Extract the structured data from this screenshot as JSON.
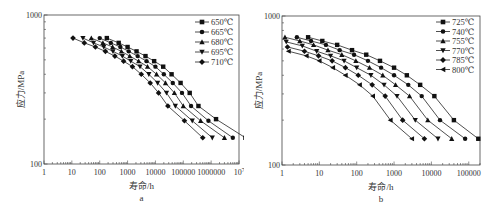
{
  "chart_data": [
    {
      "type": "line",
      "panel_label": "a",
      "xlabel": "寿命/h",
      "ylabel": "应力/MPa",
      "xscale": "log",
      "yscale": "log",
      "xlim": [
        1,
        10000000
      ],
      "ylim": [
        100,
        1000
      ],
      "x_ticks": [
        "1",
        "10",
        "100",
        "1000",
        "10000",
        "100000",
        "1000000",
        "10^7"
      ],
      "y_ticks": [
        "100",
        "1000"
      ],
      "grid": false,
      "legend_position": "upper right",
      "series": [
        {
          "name": "650℃",
          "marker": "square",
          "points": [
            [
              180,
              700
            ],
            [
              480,
              650
            ],
            [
              1000,
              610
            ],
            [
              2100,
              570
            ],
            [
              4400,
              530
            ],
            [
              9000,
              490
            ],
            [
              19000,
              450
            ],
            [
              38000,
              400
            ],
            [
              80000,
              350
            ],
            [
              170000,
              300
            ],
            [
              350000,
              245
            ],
            [
              1500000,
              200
            ],
            [
              17000000,
              150
            ]
          ]
        },
        {
          "name": "665℃",
          "marker": "circle",
          "points": [
            [
              100,
              700
            ],
            [
              250,
              650
            ],
            [
              550,
              610
            ],
            [
              1100,
              570
            ],
            [
              2300,
              530
            ],
            [
              4800,
              490
            ],
            [
              10000,
              450
            ],
            [
              20000,
              400
            ],
            [
              42000,
              350
            ],
            [
              90000,
              300
            ],
            [
              190000,
              245
            ],
            [
              800000,
              195
            ],
            [
              6000000,
              150
            ]
          ]
        },
        {
          "name": "680℃",
          "marker": "triangle-up",
          "points": [
            [
              50,
              700
            ],
            [
              130,
              650
            ],
            [
              290,
              610
            ],
            [
              600,
              570
            ],
            [
              1200,
              530
            ],
            [
              2500,
              490
            ],
            [
              5200,
              450
            ],
            [
              11000,
              400
            ],
            [
              23000,
              350
            ],
            [
              48000,
              300
            ],
            [
              100000,
              245
            ],
            [
              420000,
              195
            ],
            [
              3000000,
              150
            ]
          ]
        },
        {
          "name": "695℃",
          "marker": "triangle-down",
          "points": [
            [
              25,
              700
            ],
            [
              60,
              650
            ],
            [
              140,
              610
            ],
            [
              300,
              570
            ],
            [
              650,
              530
            ],
            [
              1300,
              490
            ],
            [
              2800,
              450
            ],
            [
              5800,
              400
            ],
            [
              12000,
              350
            ],
            [
              25000,
              300
            ],
            [
              52000,
              245
            ],
            [
              210000,
              195
            ],
            [
              1100000,
              150
            ]
          ]
        },
        {
          "name": "710℃",
          "marker": "diamond",
          "points": [
            [
              11,
              700
            ],
            [
              28,
              650
            ],
            [
              70,
              610
            ],
            [
              160,
              570
            ],
            [
              350,
              530
            ],
            [
              720,
              490
            ],
            [
              1500,
              450
            ],
            [
              3100,
              400
            ],
            [
              6500,
              350
            ],
            [
              13000,
              300
            ],
            [
              28000,
              245
            ],
            [
              110000,
              195
            ],
            [
              500000,
              150
            ]
          ]
        }
      ]
    },
    {
      "type": "line",
      "panel_label": "b",
      "xlabel": "寿命/h",
      "ylabel": "应力/MPa",
      "xscale": "log",
      "yscale": "log",
      "xlim": [
        1,
        200000
      ],
      "ylim": [
        100,
        1000
      ],
      "x_ticks": [
        "1",
        "10",
        "100",
        "1000",
        "10000",
        "100000"
      ],
      "y_ticks": [
        "100",
        "1000"
      ],
      "grid": false,
      "legend_position": "upper right",
      "series": [
        {
          "name": "725℃",
          "marker": "square",
          "points": [
            [
              5,
              720
            ],
            [
              12,
              680
            ],
            [
              30,
              640
            ],
            [
              75,
              590
            ],
            [
              180,
              550
            ],
            [
              420,
              500
            ],
            [
              1000,
              450
            ],
            [
              2200,
              400
            ],
            [
              5000,
              345
            ],
            [
              12000,
              290
            ],
            [
              40000,
              200
            ],
            [
              180000,
              150
            ]
          ]
        },
        {
          "name": "740℃",
          "marker": "circle",
          "points": [
            [
              2.5,
              720
            ],
            [
              6,
              680
            ],
            [
              15,
              640
            ],
            [
              35,
              590
            ],
            [
              85,
              550
            ],
            [
              200,
              500
            ],
            [
              450,
              450
            ],
            [
              1000,
              400
            ],
            [
              2400,
              345
            ],
            [
              5500,
              290
            ],
            [
              17000,
              200
            ],
            [
              80000,
              150
            ]
          ]
        },
        {
          "name": "755℃",
          "marker": "triangle-up",
          "points": [
            [
              1.2,
              720
            ],
            [
              3,
              680
            ],
            [
              7,
              640
            ],
            [
              17,
              590
            ],
            [
              40,
              550
            ],
            [
              95,
              500
            ],
            [
              220,
              450
            ],
            [
              500,
              400
            ],
            [
              1100,
              345
            ],
            [
              2600,
              290
            ],
            [
              8000,
              200
            ],
            [
              35000,
              150
            ]
          ]
        },
        {
          "name": "770℃",
          "marker": "triangle-down",
          "points": [
            [
              1.3,
              670
            ],
            [
              3.5,
              630
            ],
            [
              8.5,
              580
            ],
            [
              20,
              540
            ],
            [
              46,
              500
            ],
            [
              100,
              450
            ],
            [
              240,
              400
            ],
            [
              540,
              345
            ],
            [
              1200,
              290
            ],
            [
              3700,
              200
            ],
            [
              15000,
              150
            ]
          ]
        },
        {
          "name": "785℃",
          "marker": "diamond",
          "points": [
            [
              1.4,
              620
            ],
            [
              4,
              580
            ],
            [
              9.5,
              540
            ],
            [
              22,
              500
            ],
            [
              50,
              450
            ],
            [
              110,
              400
            ],
            [
              260,
              345
            ],
            [
              580,
              290
            ],
            [
              1700,
              200
            ],
            [
              6500,
              150
            ]
          ]
        },
        {
          "name": "800℃",
          "marker": "triangle-left",
          "points": [
            [
              1.5,
              580
            ],
            [
              4.5,
              540
            ],
            [
              10,
              500
            ],
            [
              23,
              450
            ],
            [
              50,
              400
            ],
            [
              120,
              345
            ],
            [
              270,
              290
            ],
            [
              800,
              200
            ],
            [
              3000,
              150
            ]
          ]
        }
      ]
    }
  ]
}
